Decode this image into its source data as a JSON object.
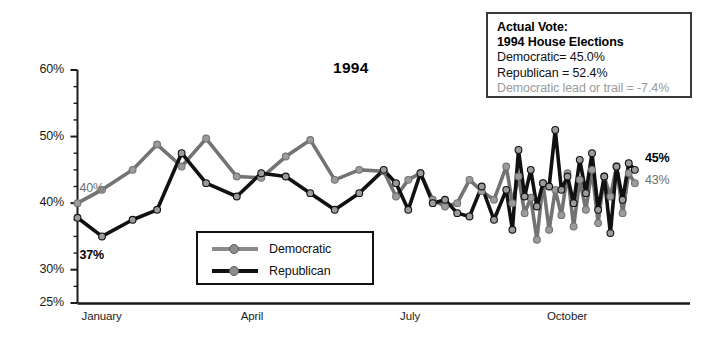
{
  "chart_data": {
    "type": "line",
    "title": "1994",
    "xlabel": "",
    "ylabel": "",
    "ylim": [
      25,
      60
    ],
    "yticks": [
      "25%",
      "30%",
      "40%",
      "50%",
      "60%"
    ],
    "ytick_values": [
      25,
      30,
      40,
      50,
      60
    ],
    "minor_tick_step": 2.5,
    "grid": false,
    "xtick_labels": [
      "January",
      "April",
      "July",
      "October"
    ],
    "xtick_positions": [
      0,
      26,
      52,
      76
    ],
    "x_range": [
      0,
      100
    ],
    "legend_position": "inside-bottom-left",
    "series": [
      {
        "name": "Democratic",
        "color": "#737373",
        "x": [
          0,
          4,
          9,
          13,
          17,
          21,
          26,
          30,
          34,
          38,
          42,
          46,
          50,
          52,
          54,
          56,
          58,
          60,
          62,
          64,
          66,
          68,
          70,
          71,
          72,
          73,
          74,
          75,
          76,
          77,
          78,
          79,
          80,
          81,
          82,
          83,
          84,
          85,
          86,
          87,
          88,
          89,
          90,
          91
        ],
        "values": [
          40.0,
          42.0,
          45.0,
          48.8,
          45.5,
          49.7,
          44.0,
          43.8,
          47.0,
          49.5,
          43.5,
          45.0,
          44.8,
          41.0,
          43.5,
          44.5,
          40.5,
          39.5,
          40.0,
          43.5,
          41.8,
          40.5,
          45.5,
          40.0,
          44.0,
          38.5,
          40.8,
          34.5,
          43.0,
          36.0,
          42.0,
          38.2,
          44.5,
          36.5,
          43.5,
          39.0,
          45.0,
          37.0,
          44.0,
          41.0,
          45.5,
          38.5,
          44.5,
          43.0
        ]
      },
      {
        "name": "Republican",
        "color": "#111111",
        "x": [
          0,
          4,
          9,
          13,
          17,
          21,
          26,
          30,
          34,
          38,
          42,
          46,
          50,
          52,
          54,
          56,
          58,
          60,
          62,
          64,
          66,
          68,
          70,
          71,
          72,
          73,
          74,
          75,
          76,
          77,
          78,
          79,
          80,
          81,
          82,
          83,
          84,
          85,
          86,
          87,
          88,
          89,
          90,
          91
        ],
        "values": [
          37.8,
          35.0,
          37.5,
          39.0,
          47.5,
          43.0,
          41.0,
          44.5,
          44.0,
          41.5,
          39.0,
          41.5,
          45.0,
          43.0,
          39.0,
          44.5,
          40.0,
          40.5,
          38.5,
          38.0,
          42.5,
          37.5,
          42.0,
          36.0,
          48.0,
          41.0,
          45.0,
          39.5,
          43.0,
          42.5,
          51.0,
          42.0,
          44.0,
          40.0,
          46.5,
          41.5,
          47.5,
          39.0,
          44.0,
          35.5,
          45.5,
          40.5,
          46.0,
          45.0
        ]
      }
    ],
    "annotations": [
      {
        "name": "dem-start-label",
        "text": "40%",
        "series": "Democratic",
        "style": "dem"
      },
      {
        "name": "rep-start-label",
        "text": "37%",
        "series": "Republican",
        "style": "rep"
      },
      {
        "name": "rep-end-label",
        "text": "45%",
        "series": "Republican",
        "style": "rep"
      },
      {
        "name": "dem-end-label",
        "text": "43%",
        "series": "Democratic",
        "style": "dem"
      }
    ]
  },
  "legend": {
    "items": [
      {
        "label": "Democratic",
        "color": "#8a8a8a"
      },
      {
        "label": "Republican",
        "color": "#111111"
      }
    ]
  },
  "actual_vote": {
    "heading_line1": "Actual Vote:",
    "heading_line2": "1994 House Elections",
    "democratic": "Democratic=  45.0%",
    "republican": "Republican = 52.4%",
    "lead_or_trail": "Democratic lead or trail = -7.4%"
  }
}
